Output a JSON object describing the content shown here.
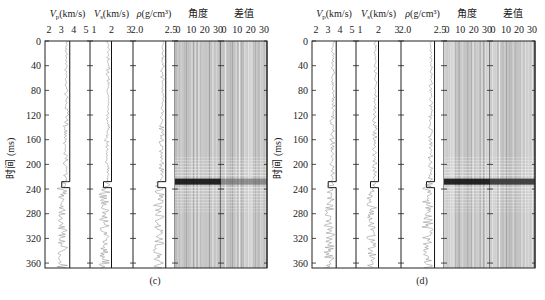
{
  "figure": {
    "panels": [
      {
        "id": "c",
        "caption": "(c)",
        "y_axis": {
          "label": "时间 (ms)",
          "ticks": [
            "0",
            "40",
            "80",
            "120",
            "160",
            "200",
            "240",
            "280",
            "320",
            "360"
          ]
        },
        "tracks": [
          {
            "name": "vp",
            "header": "V_p(km/s)",
            "header_main": "V",
            "header_sub": "p",
            "header_unit": "(km/s)",
            "ticks": [
              "2",
              "3",
              "4",
              "5"
            ]
          },
          {
            "name": "vs",
            "header": "V_s(km/s)",
            "header_main": "V",
            "header_sub": "s",
            "header_unit": "(km/s)",
            "ticks": [
              "1",
              "2",
              "3"
            ]
          },
          {
            "name": "rho",
            "header": "ρ(g/cm³)",
            "header_main": "ρ",
            "header_unit": "(g/cm³)",
            "ticks": [
              "2.0",
              "2.5"
            ]
          },
          {
            "name": "angle-gather",
            "header": "角度",
            "ticks": [
              "0",
              "10",
              "20",
              "30"
            ]
          },
          {
            "name": "residual",
            "header": "差值",
            "ticks": [
              "0",
              "10",
              "20",
              "30"
            ]
          }
        ],
        "event_time_ms": 228
      },
      {
        "id": "d",
        "caption": "(d)",
        "y_axis": {
          "label": "时间 (ms)",
          "ticks": [
            "0",
            "40",
            "80",
            "120",
            "160",
            "200",
            "240",
            "280",
            "320",
            "360"
          ]
        },
        "tracks": [
          {
            "name": "vp",
            "header": "V_p(km/s)",
            "header_main": "V",
            "header_sub": "p",
            "header_unit": "(km/s)",
            "ticks": [
              "2",
              "3",
              "4",
              "5"
            ]
          },
          {
            "name": "vs",
            "header": "V_s(km/s)",
            "header_main": "V",
            "header_sub": "s",
            "header_unit": "(km/s)",
            "ticks": [
              "1",
              "2",
              "3"
            ]
          },
          {
            "name": "rho",
            "header": "ρ(g/cm³)",
            "header_main": "ρ",
            "header_unit": "(g/cm³)",
            "ticks": [
              "2.0",
              "2.5"
            ]
          },
          {
            "name": "angle-gather",
            "header": "角度",
            "ticks": [
              "0",
              "10",
              "20",
              "30"
            ]
          },
          {
            "name": "residual",
            "header": "差值",
            "ticks": [
              "0",
              "10",
              "20",
              "30"
            ]
          }
        ],
        "event_time_ms": 228
      }
    ],
    "colors": {
      "axis": "#222222",
      "log_curve": "#333333",
      "gather_bg": "#c9c9c9",
      "event": "#111111"
    }
  }
}
